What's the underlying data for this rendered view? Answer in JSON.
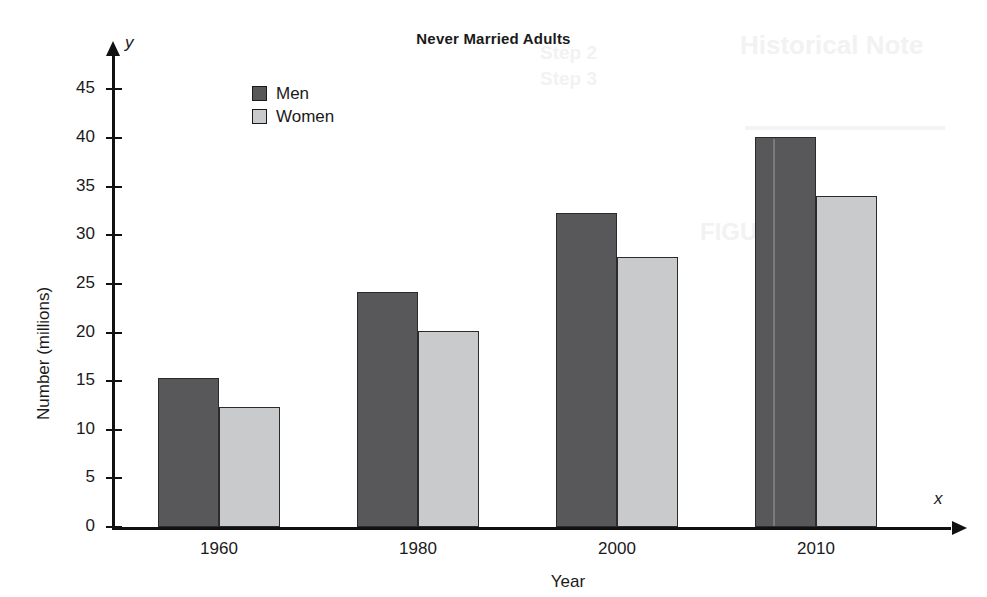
{
  "chart_data": {
    "type": "bar",
    "title": "Never Married Adults",
    "xlabel": "Year",
    "ylabel": "Number (millions)",
    "x_axis_symbol": "x",
    "y_axis_symbol": "y",
    "categories": [
      "1960",
      "1980",
      "2000",
      "2010"
    ],
    "series": [
      {
        "name": "Men",
        "color": "#58585a",
        "values": [
          15.3,
          24.2,
          32.3,
          40.1
        ]
      },
      {
        "name": "Women",
        "color": "#c9cacb",
        "values": [
          12.3,
          20.2,
          27.8,
          34.0
        ]
      }
    ],
    "ylim": [
      0,
      47
    ],
    "yticks": [
      0,
      5,
      10,
      15,
      20,
      25,
      30,
      35,
      40,
      45
    ],
    "ytick_labels": [
      "0",
      "5",
      "10",
      "15",
      "20",
      "25",
      "30",
      "35",
      "40",
      "45"
    ],
    "grid": false,
    "legend_position": "top-left-inside",
    "legend": [
      "Men",
      "Women"
    ]
  },
  "ghost_text": {
    "line1": "Historical Note",
    "line2": "Step 2",
    "line3": "Step 3",
    "line4": "FIGURE 13",
    "line5": "Year"
  }
}
